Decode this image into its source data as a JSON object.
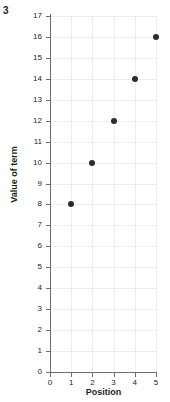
{
  "question_number": "3",
  "chart_data": {
    "type": "scatter",
    "title": "",
    "xlabel": "Position",
    "ylabel": "Value of term",
    "x": [
      1,
      2,
      3,
      4,
      5
    ],
    "values": [
      8,
      10,
      12,
      14,
      16
    ],
    "points": [
      {
        "x": 1,
        "y": 8
      },
      {
        "x": 2,
        "y": 10
      },
      {
        "x": 3,
        "y": 12
      },
      {
        "x": 4,
        "y": 14
      },
      {
        "x": 5,
        "y": 16
      }
    ],
    "xlim": [
      0,
      5
    ],
    "ylim": [
      0,
      17
    ],
    "xticks": [
      "0",
      "1",
      "2",
      "3",
      "4",
      "5"
    ],
    "yticks": [
      "0",
      "1",
      "2",
      "3",
      "4",
      "5",
      "6",
      "7",
      "8",
      "9",
      "10",
      "11",
      "12",
      "13",
      "14",
      "15",
      "16",
      "17"
    ],
    "grid": true,
    "legend": false,
    "marker_color": "#2b2b2b",
    "grid_color": "#ededed",
    "axis_color": "#6d6e71"
  }
}
